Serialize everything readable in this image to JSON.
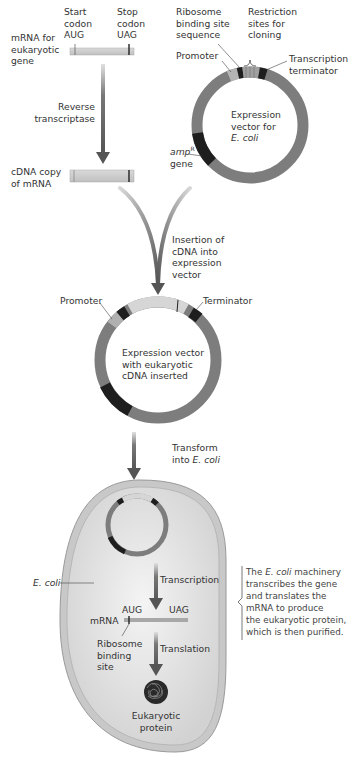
{
  "top_left": {
    "mrna_label": [
      "mRNA for",
      "eukaryotic",
      "gene"
    ],
    "start_codon_label": [
      "Start",
      "codon"
    ],
    "start_codon": "AUG",
    "stop_codon_label": [
      "Stop",
      "codon"
    ],
    "stop_codon": "UAG",
    "reverse_transcriptase_label": [
      "Reverse",
      "transcriptase"
    ],
    "cdna_label": [
      "cDNA copy",
      "of mRNA"
    ]
  },
  "expression_vector": {
    "ribosome_binding_label": [
      "Ribosome",
      "binding site",
      "sequence"
    ],
    "restriction_label": [
      "Restriction",
      "sites for",
      "cloning"
    ],
    "promoter_label": "Promoter",
    "terminator_label": [
      "Transcription",
      "terminator"
    ],
    "center_label": [
      "Expression",
      "vector for"
    ],
    "center_label_italic": "E. coli",
    "amp_label": "amp",
    "amp_sup": "R",
    "amp_gene_label": "gene"
  },
  "insertion": {
    "label": [
      "Insertion of",
      "cDNA into",
      "expression",
      "vector"
    ]
  },
  "recombinant_vector": {
    "promoter_label": "Promoter",
    "terminator_label": "Terminator",
    "center_label": [
      "Expression vector",
      "with eukaryotic",
      "cDNA inserted"
    ]
  },
  "transform": {
    "label_line1": "Transform",
    "label_line2_prefix": "into ",
    "label_line2_italic": "E. coli"
  },
  "cell": {
    "ecoli_label": "E. coli",
    "transcription_label": "Transcription",
    "mrna_label": "mRNA",
    "aug": "AUG",
    "uag": "UAG",
    "ribosome_label": [
      "Ribosome",
      "binding",
      "site"
    ],
    "translation_label": "Translation",
    "protein_label": [
      "Eukaryotic",
      "protein"
    ]
  },
  "note": {
    "line1_prefix": "The ",
    "line1_italic": "E. coli",
    "line1_suffix": " machinery",
    "lines": [
      "transcribes the gene",
      "and translates the",
      "mRNA to produce",
      "the eukaryotic protein,",
      "which is then purified."
    ]
  },
  "colors": {
    "ring": "#7d7d7d",
    "dark_segment": "#1e1e1e",
    "light_segment": "#bdbdbd",
    "insert": "#d6d6d6",
    "arrow": "#555555",
    "cell_fill": "#dcdcdc",
    "cell_wall": "#a8a8a8"
  }
}
